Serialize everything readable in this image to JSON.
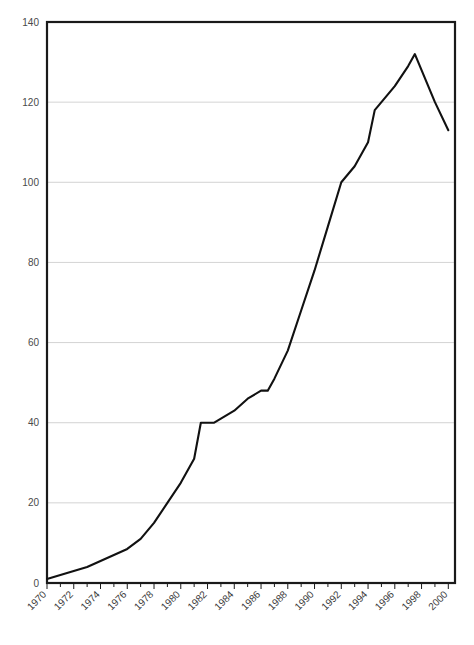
{
  "chart_data": {
    "type": "line",
    "title": "",
    "subtitle": "",
    "xlabel": "",
    "ylabel": "",
    "xlim": [
      1970,
      2000.5
    ],
    "ylim": [
      0,
      140
    ],
    "grid": true,
    "legend": false,
    "legend_position": "none",
    "y_ticks": [
      0,
      20,
      40,
      60,
      80,
      100,
      120,
      140
    ],
    "y_tick_labels": [
      "0",
      "20",
      "40",
      "60",
      "80",
      "100",
      "120",
      "140"
    ],
    "x_ticks": [
      1970,
      1972,
      1974,
      1976,
      1978,
      1980,
      1982,
      1984,
      1986,
      1988,
      1990,
      1992,
      1994,
      1996,
      1998,
      2000
    ],
    "x_tick_labels": [
      "1970",
      "1972",
      "1974",
      "1976",
      "1978",
      "1980",
      "1982",
      "1984",
      "1986",
      "1988",
      "1990",
      "1992",
      "1994",
      "1996",
      "1998",
      "2000"
    ],
    "x_minor_tick_interval": 1,
    "x_label_rotation_deg": 45,
    "line_color": "#111111",
    "grid_color": "#c8c8c8",
    "axis_color": "#1a1a1a",
    "x": [
      1970,
      1971,
      1972,
      1973,
      1974,
      1975,
      1976,
      1977,
      1978,
      1979,
      1980,
      1981,
      1981.5,
      1982.5,
      1983,
      1984,
      1985,
      1986,
      1986.5,
      1987,
      1988,
      1989,
      1990,
      1991,
      1992,
      1993,
      1994,
      1994.5,
      1995,
      1996,
      1997,
      1997.5,
      1998,
      1999,
      2000
    ],
    "y": [
      1,
      2,
      3,
      4,
      5.5,
      7,
      8.5,
      11,
      15,
      20,
      25,
      31,
      40,
      40,
      41,
      43,
      46,
      48,
      48,
      51,
      58,
      68,
      78,
      89,
      100,
      104,
      110,
      118,
      120,
      124,
      129,
      132,
      128,
      120,
      113
    ],
    "annotations": []
  }
}
